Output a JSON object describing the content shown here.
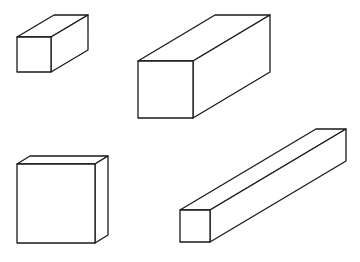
{
  "diagram": {
    "title": "",
    "stroke_color": "#1a1a1a",
    "background": "#ffffff",
    "boxes": [
      {
        "id": "box-small-cube",
        "front": {
          "x1": 17,
          "y1": 37,
          "x2": 51,
          "y2": 72
        },
        "depth": {
          "dx": 37,
          "dy": -22
        }
      },
      {
        "id": "box-long-prism",
        "front": {
          "x1": 138,
          "y1": 61,
          "x2": 193,
          "y2": 118
        },
        "depth": {
          "dx": 77,
          "dy": -46
        }
      },
      {
        "id": "box-thin-slab",
        "front": {
          "x1": 17,
          "y1": 164,
          "x2": 95,
          "y2": 243
        },
        "depth": {
          "dx": 13,
          "dy": -8
        }
      },
      {
        "id": "box-long-bar",
        "front": {
          "x1": 180,
          "y1": 210,
          "x2": 210,
          "y2": 242
        },
        "depth": {
          "dx": 136,
          "dy": -81
        }
      }
    ]
  }
}
